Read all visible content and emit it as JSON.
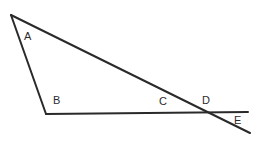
{
  "figure": {
    "background_color": "#ffffff",
    "stroke_color": "#2a2a2a",
    "stroke_width": 2,
    "width": 261,
    "height": 144,
    "label_color": "#2b2b2b",
    "label_font_size": 11
  },
  "chart_data": {
    "type": "diagram",
    "xlim": [
      0,
      261
    ],
    "ylim": [
      0,
      144
    ],
    "points": [
      {
        "id": "A",
        "x": 11,
        "y": 15,
        "label": "A",
        "label_x": 24,
        "label_y": 31
      },
      {
        "id": "B",
        "x": 46,
        "y": 114,
        "label": "B",
        "label_x": 53,
        "label_y": 95
      },
      {
        "id": "C",
        "x": 162,
        "y": 113,
        "label": "C",
        "label_x": 159,
        "label_y": 96
      },
      {
        "id": "D",
        "x": 204,
        "y": 113,
        "label": "D",
        "label_x": 202,
        "label_y": 95
      },
      {
        "id": "E",
        "x": 250,
        "y": 133,
        "label": "E",
        "label_x": 234,
        "label_y": 115
      }
    ],
    "segments": [
      {
        "name": "segment-a-b",
        "x1": 11,
        "y1": 15,
        "x2": 46,
        "y2": 114
      },
      {
        "name": "segment-a-e",
        "x1": 11,
        "y1": 15,
        "x2": 250,
        "y2": 133
      },
      {
        "name": "segment-b-right",
        "x1": 46,
        "y1": 114,
        "x2": 248,
        "y2": 112
      }
    ]
  },
  "labels": {
    "a": "A",
    "b": "B",
    "c": "C",
    "d": "D",
    "e": "E"
  }
}
